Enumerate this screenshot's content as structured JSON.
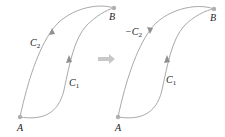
{
  "colors": {
    "curve": "#a9a9a9",
    "point": "#b0b0b0",
    "arrow_between": "#c8c8c8",
    "text": "#222222"
  },
  "left_panel": {
    "point_A": "A",
    "point_B": "B",
    "curve_upper_label": "C",
    "curve_upper_sub": "2",
    "curve_lower_label": "C",
    "curve_lower_sub": "1"
  },
  "right_panel": {
    "point_A": "A",
    "point_B": "B",
    "curve_upper_label": "−C",
    "curve_upper_sub": "2",
    "curve_lower_label": "C",
    "curve_lower_sub": "1"
  },
  "transition_arrow": "⇒"
}
